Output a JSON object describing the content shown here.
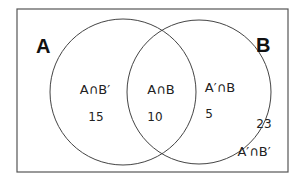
{
  "diagram": {
    "type": "venn",
    "sets": [
      {
        "name": "A",
        "label": "A"
      },
      {
        "name": "B",
        "label": "B"
      }
    ],
    "regions": [
      {
        "id": "a_only",
        "label": "A∩B′",
        "value": "15"
      },
      {
        "id": "both",
        "label": "A∩B",
        "value": "10"
      },
      {
        "id": "b_only",
        "label": "A′∩B",
        "value": "5"
      },
      {
        "id": "neither",
        "label": "A′∩B′",
        "value": "23"
      }
    ],
    "colors": {
      "stroke": "#444444",
      "background": "#ffffff",
      "text": "#222222"
    }
  }
}
